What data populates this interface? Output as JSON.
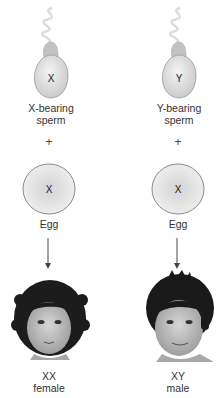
{
  "left": {
    "sperm": {
      "chromosome": "X",
      "label_line1": "X-bearing",
      "label_line2": "sperm"
    },
    "operator": "+",
    "egg": {
      "chromosome": "X",
      "label": "Egg"
    },
    "offspring": {
      "genotype": "XX",
      "sex": "female"
    }
  },
  "right": {
    "sperm": {
      "chromosome": "Y",
      "label_line1": "Y-bearing",
      "label_line2": "sperm"
    },
    "operator": "+",
    "egg": {
      "chromosome": "X",
      "label": "Egg"
    },
    "offspring": {
      "genotype": "XY",
      "sex": "male"
    }
  },
  "colors": {
    "cell_fill_light": "#f2f2f2",
    "cell_fill_dark": "#cfcfcf",
    "cell_outline": "#8a8a8a",
    "arrow": "#555555",
    "hair": "#1a1a1a",
    "skin": "#bdbdbd"
  }
}
